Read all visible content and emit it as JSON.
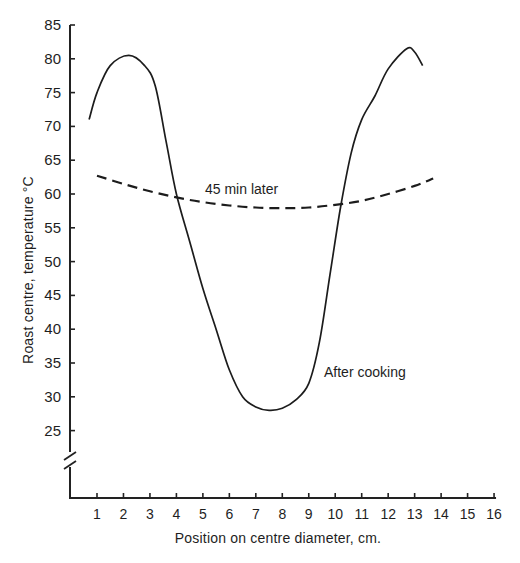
{
  "chart_data": {
    "type": "line",
    "title": "",
    "xlabel": "Position on centre diameter, cm.",
    "ylabel": "Roast centre, temperature °C",
    "xlim": [
      0,
      16
    ],
    "ylim": [
      20,
      85
    ],
    "y_axis_break": true,
    "grid": false,
    "legend": "none (series labelled inline)",
    "x_ticks": [
      "1",
      "2",
      "3",
      "4",
      "5",
      "6",
      "7",
      "8",
      "9",
      "10",
      "11",
      "12",
      "13",
      "14",
      "15",
      "16"
    ],
    "y_ticks": [
      "25",
      "30",
      "35",
      "40",
      "45",
      "50",
      "55",
      "60",
      "65",
      "70",
      "75",
      "80",
      "85"
    ],
    "series": [
      {
        "name": "After cooking",
        "style": "solid",
        "x": [
          0.7,
          1.0,
          1.5,
          2.2,
          2.8,
          3.2,
          3.6,
          4.0,
          4.5,
          5.0,
          5.5,
          6.0,
          6.5,
          7.0,
          7.5,
          8.0,
          8.5,
          9.0,
          9.4,
          9.8,
          10.2,
          10.6,
          11.0,
          11.5,
          12.0,
          12.7,
          13.0,
          13.3
        ],
        "values": [
          71,
          75,
          79,
          80.5,
          79,
          76,
          68,
          60,
          53,
          46,
          40,
          34,
          30,
          28.5,
          28,
          28.3,
          29.5,
          32,
          38,
          48,
          58,
          66,
          71,
          74.5,
          78.5,
          81.5,
          81,
          79
        ]
      },
      {
        "name": "45 min later",
        "style": "dashed",
        "x": [
          1.0,
          2.0,
          3.0,
          4.0,
          5.0,
          6.0,
          7.0,
          8.0,
          9.0,
          10.0,
          11.0,
          12.0,
          13.0,
          13.7
        ],
        "values": [
          62.7,
          61.5,
          60.4,
          59.5,
          58.8,
          58.3,
          58.0,
          57.9,
          58.0,
          58.4,
          59.0,
          60.0,
          61.2,
          62.3
        ]
      }
    ],
    "annotations": [
      {
        "text": "45 min later",
        "x": 6.3,
        "y": 61.3
      },
      {
        "text": "After cooking",
        "x": 10.5,
        "y": 34
      }
    ]
  },
  "axes": {
    "xlabel": "Position on centre diameter, cm.",
    "ylabel": "Roast centre, temperature °C"
  },
  "labels": {
    "dashed": "45 min later",
    "solid": "After cooking"
  }
}
